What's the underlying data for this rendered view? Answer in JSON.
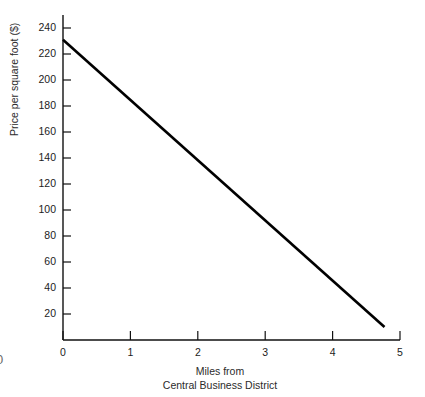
{
  "figure": {
    "corner_mark": "0",
    "background_color": "#ffffff",
    "line_color": "#000000",
    "axis_color": "#111111"
  },
  "chart_data": {
    "type": "line",
    "title": "",
    "xlabel": "Miles from",
    "xlabel_line2": "Central Business District",
    "ylabel": "Price per square foot ($)",
    "xlim": [
      0,
      5
    ],
    "ylim": [
      0,
      250
    ],
    "xticks": [
      0,
      1,
      2,
      3,
      4,
      5
    ],
    "xtick_labels": [
      "0",
      "1",
      "2",
      "3",
      "4",
      "5"
    ],
    "yticks": [
      20,
      40,
      60,
      80,
      100,
      120,
      140,
      160,
      180,
      200,
      220,
      240
    ],
    "ytick_labels": [
      "20",
      "40",
      "60",
      "80",
      "100",
      "120",
      "140",
      "160",
      "180",
      "200",
      "220",
      "240"
    ],
    "grid": false,
    "legend": false,
    "series": [
      {
        "name": "Price gradient",
        "x": [
          0,
          4.77
        ],
        "values": [
          231,
          10
        ]
      }
    ]
  }
}
